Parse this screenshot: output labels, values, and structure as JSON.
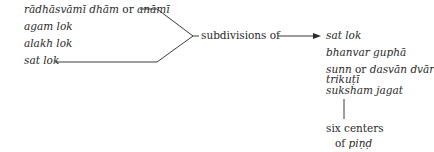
{
  "left_group": {
    "items": [
      {
        "pre": "rādhāsvāmī dhām",
        "connector": "or",
        "post": "anāmī"
      },
      {
        "text": "agam lok"
      },
      {
        "text": "alakh lok"
      },
      {
        "text": "sat lok"
      }
    ]
  },
  "relation_label": "subdivisions of",
  "right_group": {
    "items": [
      {
        "text": "sat lok"
      },
      {
        "text": "bhanvar guphā"
      },
      {
        "pre": "sunn",
        "connector": "or",
        "post": "dasvān dvār"
      },
      {
        "text": "trikuṭī"
      },
      {
        "text": "suksham jagat"
      }
    ]
  },
  "bottom_node": {
    "line1": "six centers",
    "line2_pre": "of",
    "line2_term": "piṇḍ"
  },
  "colors": {
    "ink": "#2a2a2a",
    "background": "#ffffff"
  }
}
